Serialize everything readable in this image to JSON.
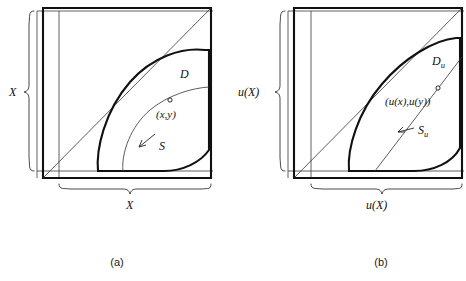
{
  "figure": {
    "background_color": "#ffffff",
    "ink_color": "#111111",
    "thin_ink_color": "#444444",
    "width": 466,
    "height": 281
  },
  "panels": [
    {
      "id": "a",
      "caption": "(a)",
      "axis_label_left": "X",
      "axis_label_bottom": "X",
      "region_label": "D",
      "curve_label": "S",
      "point_label": "(x,y)",
      "diagonal_description": "identity diagonal from lower-left corner to upper-right corner"
    },
    {
      "id": "b",
      "caption": "(b)",
      "axis_label_left": "u(X)",
      "axis_label_bottom": "u(X)",
      "region_label_base": "D",
      "region_label_sub": "u",
      "curve_label_base": "S",
      "curve_label_sub": "u",
      "point_label": "(u(x),u(y))",
      "diagonal_description": "identity diagonal from lower-left corner to upper-right corner"
    }
  ]
}
